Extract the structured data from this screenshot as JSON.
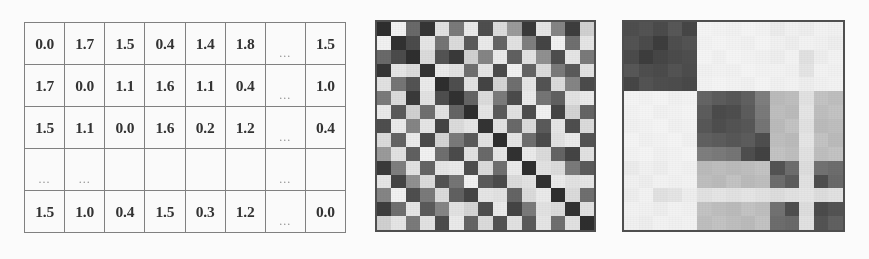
{
  "figure": {
    "background_color": "#ffffff",
    "grid_line_color": "#7d7d7d",
    "border_color": "#4a4a4a"
  },
  "table": {
    "name": "distance-matrix-table",
    "rows": 5,
    "columns": 8,
    "ellipsis_glyph": "...",
    "cells": [
      [
        "0.0",
        "1.7",
        "1.5",
        "0.4",
        "1.4",
        "1.8",
        "...",
        "1.5"
      ],
      [
        "1.7",
        "0.0",
        "1.1",
        "1.6",
        "1.1",
        "0.4",
        "...",
        "1.0"
      ],
      [
        "1.5",
        "1.1",
        "0.0",
        "1.6",
        "0.2",
        "1.2",
        "...",
        "0.4"
      ],
      [
        "...",
        "...",
        "",
        "",
        "",
        "",
        "...",
        ""
      ],
      [
        "1.5",
        "1.0",
        "0.4",
        "1.5",
        "0.3",
        "1.2",
        "...",
        "0.0"
      ]
    ]
  },
  "chart_data": [
    {
      "type": "heatmap",
      "name": "unsorted-distance-heatmap",
      "title": "",
      "xlabel": "",
      "ylabel": "",
      "rows": 15,
      "cols": 15,
      "colormap": "grayscale",
      "value_range": [
        0.0,
        1.0
      ],
      "note": "Symmetric matrix in original (unsorted) object order; dark = small distance, light = large distance",
      "values": [
        [
          0.05,
          0.95,
          0.32,
          0.08,
          0.88,
          0.4,
          0.92,
          0.2,
          0.85,
          0.55,
          0.1,
          0.9,
          0.45,
          0.12,
          0.8
        ],
        [
          0.95,
          0.06,
          0.18,
          0.9,
          0.38,
          0.85,
          0.25,
          0.92,
          0.3,
          0.88,
          0.42,
          0.15,
          0.95,
          0.35,
          0.9
        ],
        [
          0.32,
          0.18,
          0.05,
          0.85,
          0.22,
          0.1,
          0.8,
          0.45,
          0.92,
          0.28,
          0.88,
          0.5,
          0.2,
          0.9,
          0.4
        ],
        [
          0.08,
          0.9,
          0.85,
          0.07,
          0.92,
          0.88,
          0.35,
          0.9,
          0.18,
          0.95,
          0.3,
          0.85,
          0.4,
          0.25,
          0.88
        ],
        [
          0.88,
          0.38,
          0.22,
          0.92,
          0.05,
          0.2,
          0.88,
          0.15,
          0.82,
          0.35,
          0.9,
          0.22,
          0.85,
          0.45,
          0.18
        ],
        [
          0.4,
          0.85,
          0.1,
          0.88,
          0.2,
          0.06,
          0.3,
          0.85,
          0.4,
          0.18,
          0.92,
          0.38,
          0.28,
          0.88,
          0.92
        ],
        [
          0.92,
          0.25,
          0.8,
          0.35,
          0.88,
          0.3,
          0.05,
          0.9,
          0.25,
          0.88,
          0.2,
          0.95,
          0.15,
          0.82,
          0.3
        ],
        [
          0.2,
          0.92,
          0.45,
          0.9,
          0.15,
          0.85,
          0.9,
          0.07,
          0.88,
          0.32,
          0.85,
          0.25,
          0.9,
          0.2,
          0.85
        ],
        [
          0.85,
          0.3,
          0.92,
          0.18,
          0.82,
          0.4,
          0.25,
          0.88,
          0.05,
          0.9,
          0.35,
          0.18,
          0.88,
          0.92,
          0.22
        ],
        [
          0.55,
          0.88,
          0.28,
          0.95,
          0.35,
          0.18,
          0.88,
          0.32,
          0.9,
          0.06,
          0.92,
          0.85,
          0.3,
          0.15,
          0.88
        ],
        [
          0.1,
          0.42,
          0.88,
          0.3,
          0.9,
          0.92,
          0.2,
          0.85,
          0.35,
          0.92,
          0.05,
          0.88,
          0.85,
          0.4,
          0.25
        ],
        [
          0.9,
          0.15,
          0.5,
          0.85,
          0.22,
          0.38,
          0.95,
          0.25,
          0.18,
          0.85,
          0.88,
          0.06,
          0.92,
          0.88,
          0.9
        ],
        [
          0.45,
          0.95,
          0.2,
          0.4,
          0.85,
          0.28,
          0.15,
          0.9,
          0.88,
          0.3,
          0.85,
          0.92,
          0.05,
          0.85,
          0.35
        ],
        [
          0.12,
          0.35,
          0.9,
          0.25,
          0.45,
          0.88,
          0.82,
          0.2,
          0.92,
          0.15,
          0.4,
          0.88,
          0.85,
          0.07,
          0.88
        ],
        [
          0.8,
          0.9,
          0.4,
          0.88,
          0.18,
          0.92,
          0.3,
          0.85,
          0.22,
          0.88,
          0.25,
          0.9,
          0.35,
          0.88,
          0.05
        ]
      ]
    },
    {
      "type": "heatmap",
      "name": "clustered-distance-heatmap",
      "title": "",
      "xlabel": "",
      "ylabel": "",
      "rows": 15,
      "cols": 15,
      "colormap": "grayscale",
      "value_range": [
        0.0,
        1.0
      ],
      "note": "Same matrix after cluster reordering; three dark blocks appear on the diagonal",
      "cluster_blocks": [
        {
          "label": "cluster-1",
          "start": 0,
          "end": 4
        },
        {
          "label": "cluster-2",
          "start": 5,
          "end": 9
        },
        {
          "label": "cluster-3",
          "start": 10,
          "end": 14
        }
      ],
      "values": [
        [
          0.2,
          0.22,
          0.18,
          0.24,
          0.16,
          0.97,
          0.96,
          0.95,
          0.97,
          0.96,
          0.93,
          0.95,
          0.94,
          0.96,
          0.95
        ],
        [
          0.22,
          0.18,
          0.12,
          0.2,
          0.22,
          0.96,
          0.97,
          0.96,
          0.95,
          0.97,
          0.95,
          0.94,
          0.96,
          0.95,
          0.94
        ],
        [
          0.18,
          0.12,
          0.16,
          0.18,
          0.2,
          0.97,
          0.95,
          0.97,
          0.96,
          0.95,
          0.94,
          0.96,
          0.88,
          0.94,
          0.96
        ],
        [
          0.24,
          0.2,
          0.18,
          0.22,
          0.19,
          0.95,
          0.96,
          0.95,
          0.97,
          0.96,
          0.96,
          0.95,
          0.9,
          0.96,
          0.95
        ],
        [
          0.16,
          0.22,
          0.2,
          0.19,
          0.17,
          0.96,
          0.97,
          0.96,
          0.95,
          0.97,
          0.95,
          0.96,
          0.94,
          0.95,
          0.96
        ],
        [
          0.97,
          0.96,
          0.97,
          0.95,
          0.96,
          0.3,
          0.26,
          0.24,
          0.28,
          0.42,
          0.7,
          0.72,
          0.88,
          0.74,
          0.72
        ],
        [
          0.96,
          0.97,
          0.95,
          0.96,
          0.97,
          0.26,
          0.18,
          0.2,
          0.26,
          0.4,
          0.72,
          0.7,
          0.9,
          0.72,
          0.74
        ],
        [
          0.95,
          0.96,
          0.97,
          0.95,
          0.96,
          0.24,
          0.2,
          0.22,
          0.24,
          0.38,
          0.7,
          0.74,
          0.88,
          0.7,
          0.72
        ],
        [
          0.97,
          0.95,
          0.96,
          0.97,
          0.95,
          0.28,
          0.26,
          0.24,
          0.26,
          0.2,
          0.72,
          0.7,
          0.9,
          0.74,
          0.7
        ],
        [
          0.96,
          0.97,
          0.95,
          0.96,
          0.97,
          0.42,
          0.4,
          0.38,
          0.2,
          0.14,
          0.74,
          0.72,
          0.88,
          0.72,
          0.74
        ],
        [
          0.93,
          0.95,
          0.94,
          0.96,
          0.95,
          0.7,
          0.72,
          0.7,
          0.72,
          0.74,
          0.22,
          0.34,
          0.86,
          0.36,
          0.34
        ],
        [
          0.95,
          0.94,
          0.96,
          0.95,
          0.96,
          0.72,
          0.7,
          0.74,
          0.7,
          0.72,
          0.34,
          0.26,
          0.88,
          0.2,
          0.32
        ],
        [
          0.94,
          0.96,
          0.88,
          0.9,
          0.94,
          0.88,
          0.9,
          0.88,
          0.9,
          0.88,
          0.86,
          0.88,
          0.9,
          0.86,
          0.88
        ],
        [
          0.96,
          0.95,
          0.94,
          0.96,
          0.95,
          0.74,
          0.72,
          0.7,
          0.74,
          0.72,
          0.36,
          0.2,
          0.86,
          0.18,
          0.22
        ],
        [
          0.95,
          0.94,
          0.96,
          0.95,
          0.96,
          0.72,
          0.74,
          0.72,
          0.7,
          0.74,
          0.34,
          0.32,
          0.88,
          0.22,
          0.28
        ]
      ]
    }
  ]
}
